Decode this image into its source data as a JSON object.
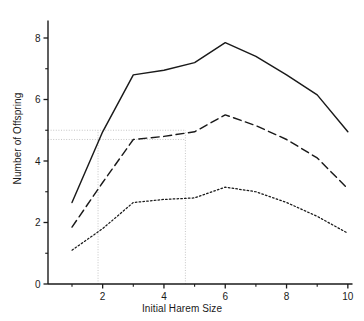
{
  "chart_data": {
    "type": "line",
    "title": "",
    "xlabel": "Initial Harem Size",
    "ylabel": "Number of Offspring",
    "xlim": [
      0.25,
      10.4
    ],
    "ylim": [
      0,
      9.0
    ],
    "grid": false,
    "legend": "none",
    "x": [
      1,
      2,
      3,
      4,
      5,
      6,
      7,
      8,
      9,
      10
    ],
    "xticks_major": [
      2,
      4,
      6,
      8,
      10
    ],
    "xticks_minor": [
      1,
      3,
      5,
      7,
      9
    ],
    "yticks_major": [
      0,
      2,
      4,
      6,
      8
    ],
    "yticks_minor": [
      1,
      3,
      5,
      7,
      9
    ],
    "series": [
      {
        "name": "upper curve",
        "style": "solid",
        "color": "#1a1a1a",
        "values": [
          2.65,
          4.95,
          6.8,
          6.95,
          7.2,
          7.85,
          7.4,
          6.8,
          6.15,
          4.95
        ]
      },
      {
        "name": "middle curve",
        "style": "dashed",
        "color": "#1a1a1a",
        "values": [
          1.85,
          3.3,
          4.7,
          4.8,
          4.95,
          5.5,
          5.15,
          4.7,
          4.1,
          3.1
        ]
      },
      {
        "name": "lower curve",
        "style": "dotted",
        "color": "#1a1a1a",
        "values": [
          1.1,
          1.8,
          2.65,
          2.75,
          2.8,
          3.15,
          3.0,
          2.65,
          2.2,
          1.65
        ]
      }
    ],
    "reference_lines": [
      {
        "name": "horizontal-reference-upper",
        "orientation": "horizontal",
        "value": 5.0,
        "x_from": 0.25,
        "x_to": 4.7
      },
      {
        "name": "horizontal-reference-lower",
        "orientation": "horizontal",
        "value": 4.7,
        "x_from": 0.25,
        "x_to": 4.7
      },
      {
        "name": "vertical-reference-left",
        "orientation": "vertical",
        "value": 1.85,
        "y_from": 0,
        "y_to": 5.0
      },
      {
        "name": "vertical-reference-right",
        "orientation": "vertical",
        "value": 4.7,
        "y_from": 0,
        "y_to": 5.0
      }
    ],
    "tick_labels": {
      "x": [
        "2",
        "4",
        "6",
        "8",
        "10"
      ],
      "y": [
        "0",
        "2",
        "4",
        "6",
        "8"
      ]
    }
  }
}
